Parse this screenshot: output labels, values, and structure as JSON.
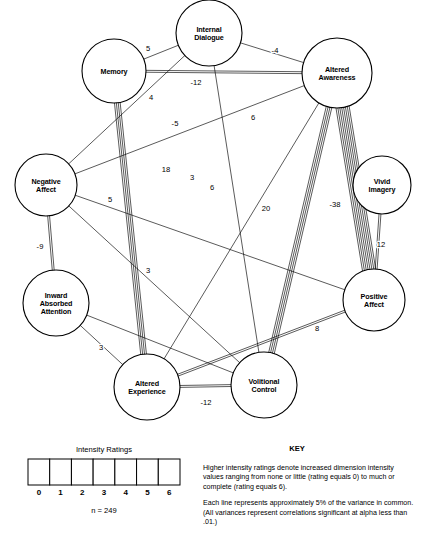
{
  "nodes": [
    {
      "id": "internal_dialogue",
      "label": "Internal\nDialogue",
      "line1": "Internal",
      "line2": "Dialogue",
      "x": 209,
      "y": 33,
      "r": 33,
      "hatch": "hatch5"
    },
    {
      "id": "memory",
      "label": "Memory",
      "line1": "Memory",
      "line2": "",
      "x": 114,
      "y": 71,
      "r": 32,
      "hatch": "hatch3"
    },
    {
      "id": "altered_awareness",
      "label": "Altered\nAwareness",
      "line1": "Altered",
      "line2": "Awareness",
      "x": 337,
      "y": 73,
      "r": 35,
      "hatch": "hatch5"
    },
    {
      "id": "negative_affect",
      "label": "Negative\nAffect",
      "line1": "Negative",
      "line2": "Affect",
      "x": 46,
      "y": 185,
      "r": 31,
      "hatch": "hatch6"
    },
    {
      "id": "vivid_imagery",
      "label": "Vivid\nImagery",
      "line1": "Vivid",
      "line2": "Imagery",
      "x": 382,
      "y": 185,
      "r": 29,
      "hatch": "hatch5"
    },
    {
      "id": "inward_absorbed_attention",
      "label": "Inward\nAbsorbed\nAttention",
      "line1": "Inward",
      "line2": "Absorbed",
      "line3": "Attention",
      "x": 56,
      "y": 303,
      "r": 33,
      "hatch": "hatch5"
    },
    {
      "id": "positive_affect",
      "label": "Positive\nAffect",
      "line1": "Positive",
      "line2": "Affect",
      "x": 374,
      "y": 300,
      "r": 31,
      "hatch": "hatch5"
    },
    {
      "id": "altered_experience",
      "label": "Altered\nExperience",
      "line1": "Altered",
      "line2": "Experience",
      "x": 147,
      "y": 387,
      "r": 33,
      "hatch": "hatch3"
    },
    {
      "id": "volitional_control",
      "label": "Volitional\nControl",
      "line1": "Volitional",
      "line2": "Control",
      "x": 264,
      "y": 385,
      "r": 33,
      "hatch": "hatch5"
    }
  ],
  "edges": [
    {
      "from": "memory",
      "to": "internal_dialogue",
      "value": "5",
      "lines": 1,
      "label_x": 148,
      "label_y": 51
    },
    {
      "from": "internal_dialogue",
      "to": "altered_awareness",
      "value": "-4",
      "lines": 1,
      "label_x": 275,
      "label_y": 53
    },
    {
      "from": "memory",
      "to": "altered_awareness",
      "value": "-12",
      "lines": 2,
      "label_x": 196,
      "label_y": 85
    },
    {
      "from": "negative_affect",
      "to": "internal_dialogue",
      "value": "4",
      "lines": 1,
      "label_x": 151,
      "label_y": 100
    },
    {
      "from": "negative_affect",
      "to": "altered_awareness",
      "value": "-5",
      "lines": 1,
      "label_x": 175,
      "label_y": 126
    },
    {
      "from": "memory",
      "to": "altered_experience",
      "value": "18",
      "lines": 4,
      "label_x": 166,
      "label_y": 172
    },
    {
      "from": "internal_dialogue",
      "to": "volitional_control",
      "value": "6",
      "lines": 1,
      "label_x": 253,
      "label_y": 120
    },
    {
      "from": "altered_awareness",
      "to": "altered_experience",
      "value": "6",
      "lines": 1,
      "label_x": 212,
      "label_y": 190
    },
    {
      "from": "altered_awareness",
      "to": "volitional_control",
      "value": "20",
      "lines": 4,
      "label_x": 266,
      "label_y": 211
    },
    {
      "from": "altered_awareness",
      "to": "positive_affect",
      "value": "-38",
      "lines": 8,
      "label_x": 335,
      "label_y": 207
    },
    {
      "from": "negative_affect",
      "to": "volitional_control",
      "value": "3",
      "lines": 1,
      "label_x": 192,
      "label_y": 180
    },
    {
      "from": "negative_affect",
      "to": "positive_affect",
      "value": "5",
      "lines": 1,
      "label_x": 110,
      "label_y": 202
    },
    {
      "from": "negative_affect",
      "to": "inward_absorbed_attention",
      "value": "-9",
      "lines": 2,
      "label_x": 40,
      "label_y": 249
    },
    {
      "from": "vivid_imagery",
      "to": "positive_affect",
      "value": "12",
      "lines": 2,
      "label_x": 381,
      "label_y": 247
    },
    {
      "from": "inward_absorbed_attention",
      "to": "volitional_control",
      "value": "3",
      "lines": 1,
      "label_x": 148,
      "label_y": 273
    },
    {
      "from": "inward_absorbed_attention",
      "to": "altered_experience",
      "value": "3",
      "lines": 1,
      "label_x": 101,
      "label_y": 350
    },
    {
      "from": "altered_experience",
      "to": "positive_affect",
      "value": "8",
      "lines": 2,
      "label_x": 317,
      "label_y": 331
    },
    {
      "from": "altered_experience",
      "to": "volitional_control",
      "value": "-12",
      "lines": 2,
      "label_x": 206,
      "label_y": 405
    }
  ],
  "legend": {
    "title": "Intensity Ratings",
    "ticks": [
      "0",
      "1",
      "2",
      "3",
      "4",
      "5",
      "6"
    ],
    "sample_size": "n = 249",
    "box": {
      "x": 28,
      "y": 459,
      "width": 152,
      "height": 26
    }
  },
  "key": {
    "heading": "KEY",
    "paragraphs": [
      "Higher intensity ratings denote increased dimension intensity values ranging from none or little (rating equals 0) to much or complete (rating equals 6).",
      "Each line represents approximately 5% of the variance in common. (All variances represent correlations significant at alpha less than .01.)"
    ]
  },
  "colors": {
    "stroke": "#000000",
    "background": "#ffffff"
  }
}
